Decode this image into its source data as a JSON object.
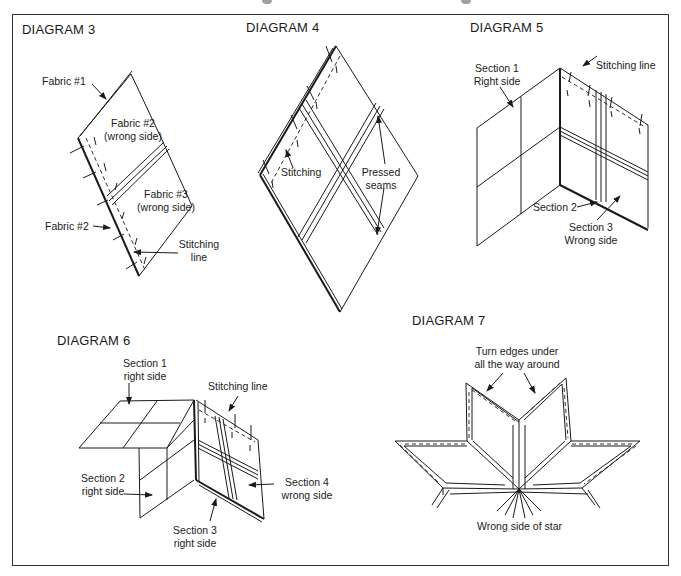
{
  "page": {
    "frame_color": "#333333",
    "ink_color": "#1a1a1a"
  },
  "diagrams": [
    {
      "id": "diagram-3",
      "title": "DIAGRAM 3",
      "labels": {
        "fabric1": "Fabric #1",
        "fabric2_wrong_l1": "Fabric #2",
        "fabric2_wrong_l2": "(wrong side)",
        "fabric3_wrong_l1": "Fabric #3",
        "fabric3_wrong_l2": "(wrong side)",
        "fabric2": "Fabric #2",
        "stitching_l1": "Stitching",
        "stitching_l2": "line"
      }
    },
    {
      "id": "diagram-4",
      "title": "DIAGRAM 4",
      "labels": {
        "stitching": "Stitching",
        "pressed_l1": "Pressed",
        "pressed_l2": "seams"
      }
    },
    {
      "id": "diagram-5",
      "title": "DIAGRAM 5",
      "labels": {
        "section1_l1": "Section 1",
        "section1_l2": "Right side",
        "stitching_line": "Stitching line",
        "section2": "Section 2",
        "section3_l1": "Section 3",
        "section3_l2": "Wrong side"
      }
    },
    {
      "id": "diagram-6",
      "title": "DIAGRAM 6",
      "labels": {
        "section1_l1": "Section 1",
        "section1_l2": "right side",
        "stitching_line": "Stitching line",
        "section2_l1": "Section 2",
        "section2_l2": "right side",
        "section4_l1": "Section 4",
        "section4_l2": "wrong side",
        "section3_l1": "Section 3",
        "section3_l2": "right side"
      }
    },
    {
      "id": "diagram-7",
      "title": "DIAGRAM 7",
      "labels": {
        "turn_l1": "Turn edges under",
        "turn_l2": "all the way around",
        "wrong_side": "Wrong side of star"
      }
    }
  ]
}
